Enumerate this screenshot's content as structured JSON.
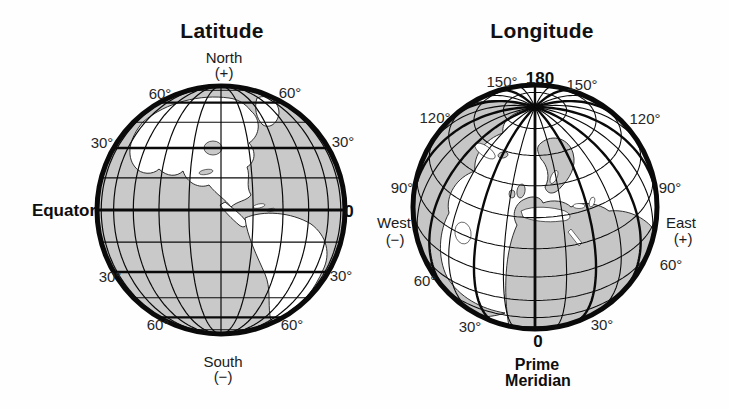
{
  "latitude_globe": {
    "title": "Latitude",
    "north_label": "North",
    "north_sign": "(+)",
    "south_label": "South",
    "south_sign": "(−)",
    "equator_label": "Equator",
    "equator_value": "0",
    "ring_labels": {
      "n60_left": "60°",
      "n60_right": "60°",
      "n30_left": "30°",
      "n30_right": "30°",
      "s30_left": "30°",
      "s30_right": "30°",
      "s60_left": "60°",
      "s60_right": "60°"
    },
    "graticule": {
      "line_spacing_deg": 15,
      "label_spacing_deg": 30,
      "bold_lines_deg": [
        0,
        30,
        60
      ]
    }
  },
  "longitude_globe": {
    "title": "Longitude",
    "top_value": "180",
    "west_label": "West",
    "west_sign": "(−)",
    "east_label": "East",
    "east_sign": "(+)",
    "prime_meridian_value": "0",
    "prime_meridian_line1": "Prime",
    "prime_meridian_line2": "Meridian",
    "ring_labels": {
      "l150_left": "150°",
      "l150_right": "150°",
      "l120_left": "120°",
      "l120_right": "120°",
      "l90_left": "90°",
      "l90_right": "90°",
      "l60_left": "60°",
      "l60_right": "60°",
      "l30_left": "30°",
      "l30_right": "30°"
    },
    "graticule": {
      "line_spacing_deg": 15,
      "label_spacing_deg": 30,
      "pole_tilt_deg": 35
    }
  },
  "colors": {
    "background": "#fefefe",
    "line": "#0a0a0a",
    "left_ocean": "#c9c9c9",
    "left_land": "#ffffff",
    "right_ocean": "#ffffff",
    "right_land": "#c6c6c6",
    "coastline": "#1a1a1a"
  }
}
